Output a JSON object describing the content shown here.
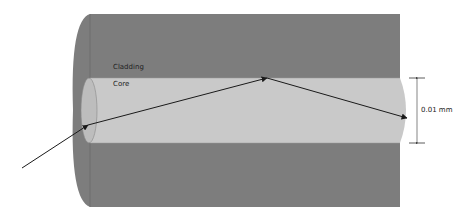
{
  "diagram": {
    "labels": {
      "cladding": "Cladding",
      "core": "Core",
      "dimension": "0.01 mm"
    },
    "colors": {
      "background": "#ffffff",
      "cladding": "#7d7d7d",
      "cladding_edge": "#6a6a6a",
      "core": "#c8c8c8",
      "core_end": "#bdbdbd",
      "ray": "#1a1a1a",
      "dimension_line": "#333333"
    },
    "geometry": {
      "cladding": {
        "x1": 75,
        "x2": 400,
        "y1": 14,
        "y2": 207
      },
      "core": {
        "y1": 78,
        "y2": 143
      },
      "ray_points": [
        [
          22,
          168
        ],
        [
          88,
          125
        ],
        [
          267,
          78
        ],
        [
          407,
          118
        ]
      ],
      "dimension": {
        "x": 417,
        "y1": 78,
        "y2": 143
      }
    },
    "nodes": [
      {
        "id": "cladding",
        "label": "Cladding"
      },
      {
        "id": "core",
        "label": "Core"
      }
    ],
    "edges": [
      {
        "from": "incident-ray",
        "to": "core-entry"
      },
      {
        "from": "core-entry",
        "to": "reflection-point"
      },
      {
        "from": "reflection-point",
        "to": "core-exit"
      }
    ]
  }
}
